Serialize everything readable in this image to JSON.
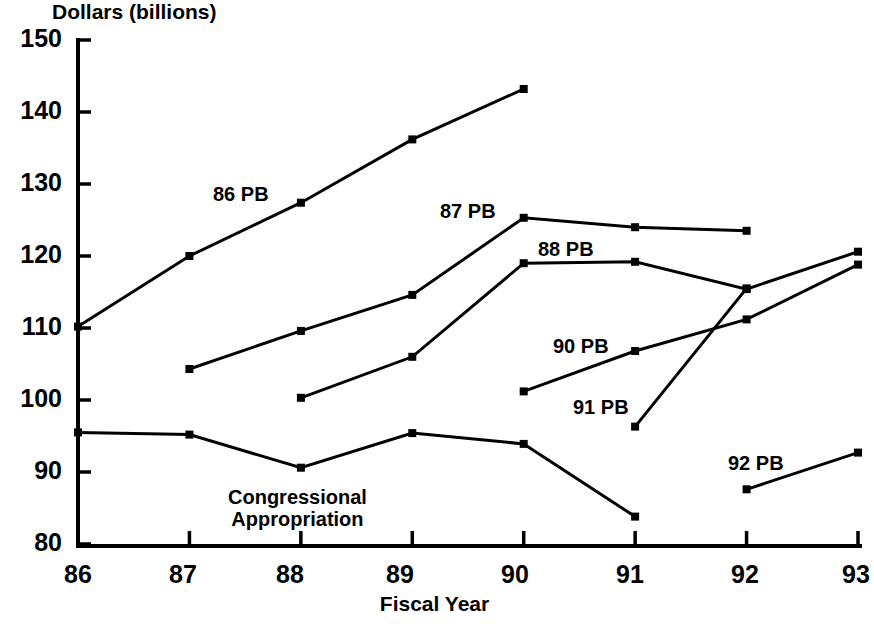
{
  "chart_data": {
    "type": "line",
    "title": "",
    "xlabel": "Fiscal Year",
    "ylabel": "Dollars (billions)",
    "xlim": [
      86,
      93
    ],
    "ylim": [
      80,
      150
    ],
    "grid": false,
    "legend_position": "inline-labels",
    "x_tick_labels": [
      "86",
      "87",
      "88",
      "89",
      "90",
      "91",
      "92",
      "93"
    ],
    "y_tick_labels": [
      "80",
      "90",
      "100",
      "110",
      "120",
      "130",
      "140",
      "150"
    ],
    "series": [
      {
        "name": "86 PB",
        "label": "86 PB",
        "x": [
          86,
          87,
          88,
          89,
          90
        ],
        "values": [
          110.2,
          120.0,
          127.4,
          136.2,
          143.2
        ]
      },
      {
        "name": "87 PB",
        "label": "87 PB",
        "x": [
          87,
          88,
          89,
          90,
          91,
          92
        ],
        "values": [
          104.3,
          109.6,
          114.6,
          125.3,
          124.0,
          123.5
        ]
      },
      {
        "name": "88 PB",
        "label": "88 PB",
        "x": [
          88,
          89,
          90,
          91,
          92,
          93
        ],
        "values": [
          100.3,
          106.0,
          119.0,
          119.2,
          115.4,
          120.6
        ]
      },
      {
        "name": "90 PB",
        "label": "90 PB",
        "x": [
          90,
          91,
          92,
          93
        ],
        "values": [
          101.2,
          106.8,
          111.2,
          118.8
        ]
      },
      {
        "name": "91 PB",
        "label": "91 PB",
        "x": [
          91,
          92
        ],
        "values": [
          96.3,
          115.5
        ]
      },
      {
        "name": "92 PB",
        "label": "92 PB",
        "x": [
          92,
          93
        ],
        "values": [
          87.6,
          92.7
        ]
      },
      {
        "name": "Congressional Appropriation",
        "label_line1": "Congressional",
        "label_line2": "Appropriation",
        "x": [
          86,
          87,
          88,
          89,
          90,
          91
        ],
        "values": [
          95.5,
          95.2,
          90.6,
          95.4,
          93.9,
          83.8
        ]
      }
    ]
  },
  "axis": {
    "y_title": "Dollars (billions)",
    "x_title": "Fiscal Year",
    "y_ticks": [
      "150",
      "140",
      "130",
      "120",
      "110",
      "100",
      "90",
      "80"
    ],
    "x_ticks": [
      "86",
      "87",
      "88",
      "89",
      "90",
      "91",
      "92",
      "93"
    ]
  },
  "labels": {
    "pb86": "86 PB",
    "pb87": "87 PB",
    "pb88": "88 PB",
    "pb90": "90 PB",
    "pb91": "91 PB",
    "pb92": "92 PB",
    "congressional_line1": "Congressional",
    "congressional_line2": "Appropriation"
  },
  "colors": {
    "line": "#000000",
    "background": "#ffffff",
    "text": "#000000"
  }
}
